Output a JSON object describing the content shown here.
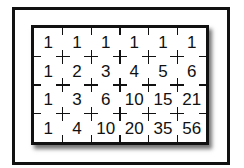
{
  "diagram": {
    "rows": [
      [
        "1",
        "1",
        "1",
        "1",
        "1",
        "1"
      ],
      [
        "1",
        "2",
        "3",
        "4",
        "5",
        "6"
      ],
      [
        "1",
        "3",
        "6",
        "10",
        "15",
        "21"
      ],
      [
        "1",
        "4",
        "10",
        "20",
        "35",
        "56"
      ]
    ],
    "colors": {
      "frame": "#111111",
      "background": "#ffffff",
      "text": "#111111"
    }
  }
}
